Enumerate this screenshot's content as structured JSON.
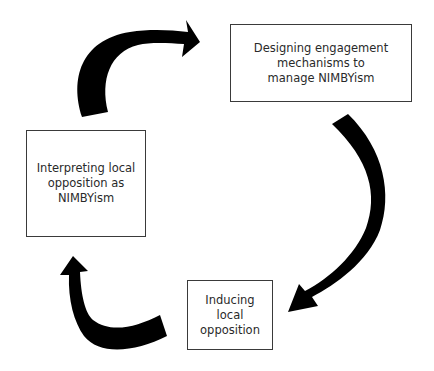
{
  "diagram": {
    "type": "cycle",
    "nodes": [
      {
        "id": "design",
        "label": "Designing engagement\nmechanisms to\nmanage NIMBYism"
      },
      {
        "id": "induce",
        "label": "Inducing\nlocal\nopposition"
      },
      {
        "id": "interpret",
        "label": "Interpreting local\nopposition as\nNIMBYism"
      }
    ],
    "edges": [
      {
        "from": "interpret",
        "to": "design"
      },
      {
        "from": "design",
        "to": "induce"
      },
      {
        "from": "induce",
        "to": "interpret"
      }
    ],
    "colors": {
      "arrow": "#000000",
      "box_border": "#3a3a3a",
      "text": "#2a2a2a",
      "background": "#ffffff"
    }
  }
}
